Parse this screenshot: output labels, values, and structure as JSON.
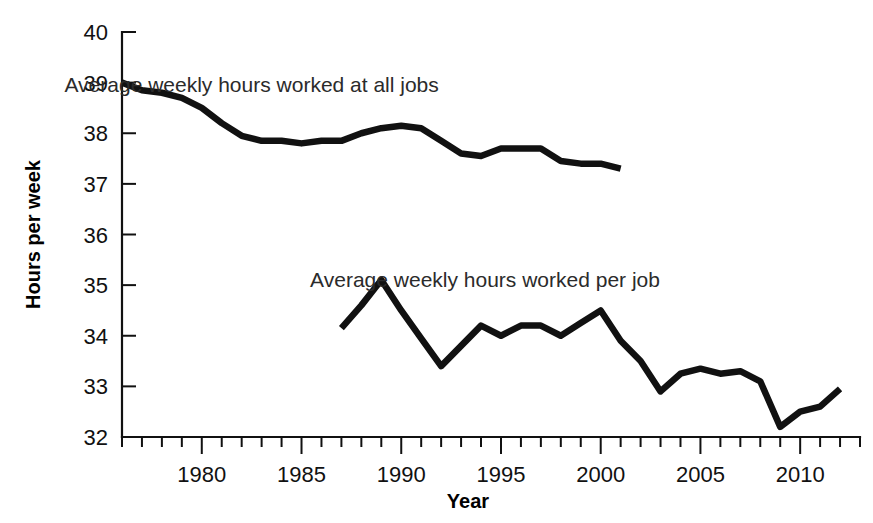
{
  "chart_data": {
    "type": "line",
    "title": "",
    "xlabel": "Year",
    "ylabel": "Hours per week",
    "xlim": [
      1976,
      2013
    ],
    "ylim": [
      32,
      40
    ],
    "grid": false,
    "legend_position": "inline-annotations",
    "y_ticks": [
      32,
      33,
      34,
      35,
      36,
      37,
      38,
      39,
      40
    ],
    "y_tick_labels": [
      "32",
      "33",
      "34",
      "35",
      "36",
      "37",
      "38",
      "39",
      "40"
    ],
    "x_major_ticks": [
      1980,
      1985,
      1990,
      1995,
      2000,
      2005,
      2010
    ],
    "x_major_tick_labels": [
      "1980",
      "1985",
      "1990",
      "1995",
      "2000",
      "2005",
      "2010"
    ],
    "x_minor_tick_step": 1,
    "series": [
      {
        "name": "Average weekly hours worked at all jobs",
        "label_x": 1982.5,
        "label_y": 38.95,
        "x": [
          1976,
          1977,
          1978,
          1979,
          1980,
          1981,
          1982,
          1983,
          1984,
          1985,
          1986,
          1987,
          1988,
          1989,
          1990,
          1991,
          1992,
          1993,
          1994,
          1995,
          1996,
          1997,
          1998,
          1999,
          2000,
          2001
        ],
        "values": [
          39.0,
          38.85,
          38.8,
          38.7,
          38.5,
          38.2,
          37.95,
          37.85,
          37.85,
          37.8,
          37.85,
          37.85,
          38.0,
          38.1,
          38.15,
          38.1,
          37.85,
          37.6,
          37.55,
          37.7,
          37.7,
          37.7,
          37.45,
          37.4,
          37.4,
          37.3
        ]
      },
      {
        "name": "Average weekly hours worked per job",
        "label_x": 1994.2,
        "label_y": 35.1,
        "x": [
          1987,
          1988,
          1989,
          1990,
          1991,
          1992,
          1993,
          1994,
          1995,
          1996,
          1997,
          1998,
          1999,
          2000,
          2001,
          2002,
          2003,
          2004,
          2005,
          2006,
          2007,
          2008,
          2009,
          2010,
          2011,
          2012
        ],
        "values": [
          34.15,
          34.6,
          35.1,
          34.5,
          33.95,
          33.4,
          33.8,
          34.2,
          34.0,
          34.2,
          34.2,
          34.0,
          34.25,
          34.5,
          33.9,
          33.5,
          32.9,
          33.25,
          33.35,
          33.25,
          33.3,
          33.1,
          32.2,
          32.5,
          32.6,
          32.95
        ]
      }
    ]
  }
}
